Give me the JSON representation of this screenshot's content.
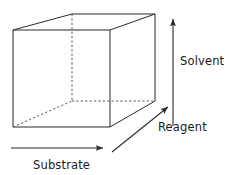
{
  "figure": {
    "name": "three-dimensional-reaction-space-cube",
    "background_color": "#ffffff",
    "line_color": "#2b2b2b",
    "dashed_line_color": "#55555f",
    "text_color": "#1a1a1a"
  },
  "cube": {
    "description": "wireframe rectangular box drawn in oblique projection",
    "front_face": {
      "top_left": [
        13,
        30
      ],
      "top_right": [
        110,
        30
      ],
      "bottom_right": [
        110,
        127
      ],
      "bottom_left": [
        13,
        127
      ]
    },
    "back_face": {
      "top_left": [
        72,
        14
      ],
      "top_right": [
        155,
        14
      ],
      "bottom_right": [
        155,
        101
      ],
      "bottom_left": [
        72,
        101
      ]
    },
    "hidden_edges": [
      "back-left-vertical",
      "back-bottom-left-to-back-bottom-right",
      "front-bottom-left-to-back-bottom-left"
    ]
  },
  "axes": [
    {
      "id": "solvent",
      "label": "Solvent",
      "orientation": "vertical",
      "direction": "up",
      "arrow_start": [
        173,
        126
      ],
      "arrow_end": [
        173,
        19
      ],
      "label_position": [
        180,
        65
      ]
    },
    {
      "id": "reagent",
      "label": "Reagent",
      "orientation": "diagonal",
      "direction": "up-right",
      "arrow_start": [
        112,
        152
      ],
      "arrow_end": [
        168,
        107
      ],
      "label_position": [
        158,
        131
      ]
    },
    {
      "id": "substrate",
      "label": "Substrate",
      "orientation": "horizontal",
      "direction": "right",
      "arrow_start": [
        11,
        148
      ],
      "arrow_end": [
        103,
        148
      ],
      "label_position": [
        33,
        169
      ]
    }
  ]
}
